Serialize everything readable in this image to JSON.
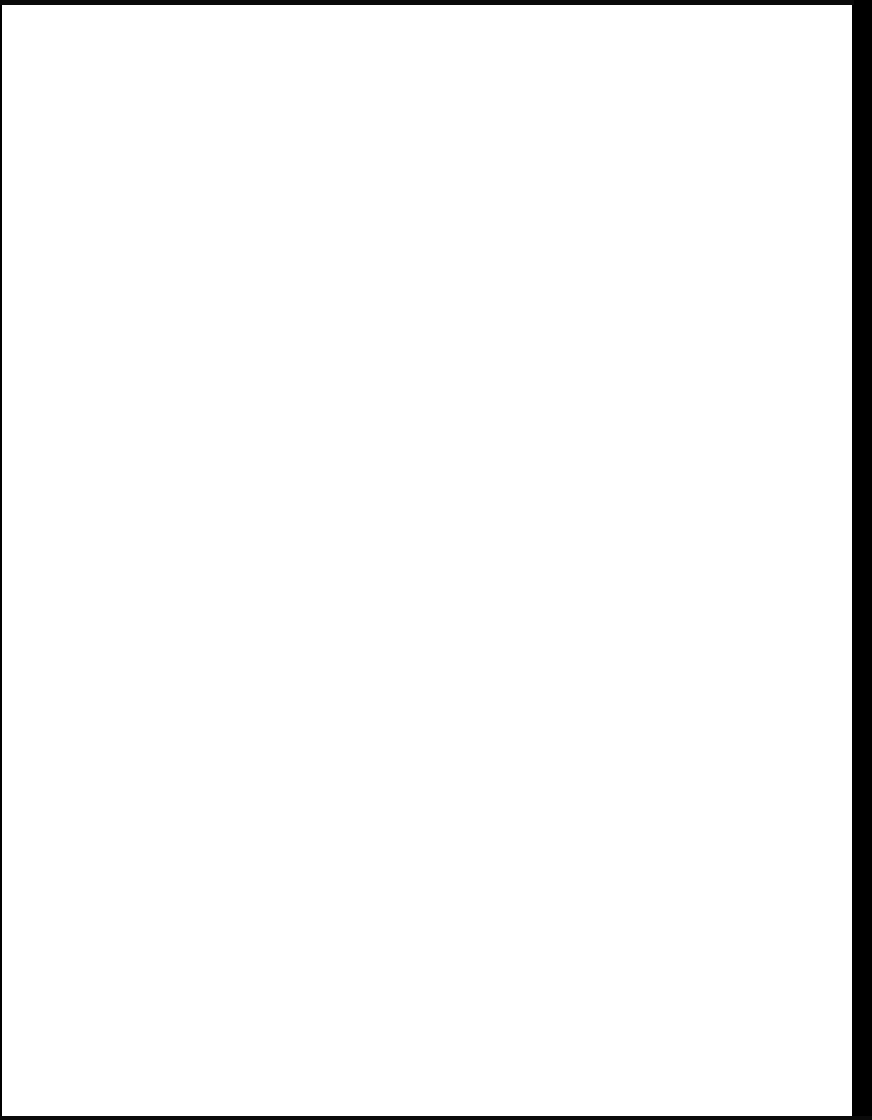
{
  "document": {
    "type": "scanned-page",
    "content": "",
    "colors": {
      "page": "#ffffff",
      "border": "#000000"
    }
  }
}
